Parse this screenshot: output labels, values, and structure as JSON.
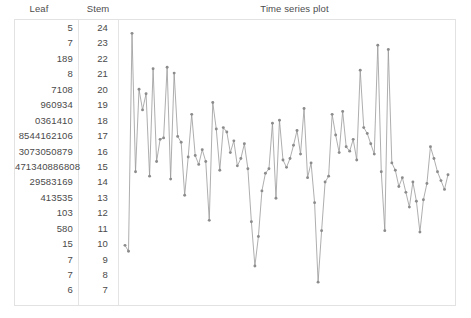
{
  "header": {
    "leaf_label": "Leaf",
    "stem_label": "Stem",
    "plot_title": "Time series plot"
  },
  "colors": {
    "text": "#4a4a4a",
    "border": "#e2e2e2",
    "series_line": "#999999",
    "series_marker": "#8c8c8c",
    "background": "#ffffff"
  },
  "stem_leaf": {
    "rows": [
      {
        "leaf": "5",
        "stem": "24"
      },
      {
        "leaf": "7",
        "stem": "23"
      },
      {
        "leaf": "189",
        "stem": "22"
      },
      {
        "leaf": "8",
        "stem": "21"
      },
      {
        "leaf": "7108",
        "stem": "20"
      },
      {
        "leaf": "960934",
        "stem": "19"
      },
      {
        "leaf": "0361410",
        "stem": "18"
      },
      {
        "leaf": "8544162106",
        "stem": "17"
      },
      {
        "leaf": "3073050879",
        "stem": "16"
      },
      {
        "leaf": "471340886808",
        "stem": "15"
      },
      {
        "leaf": "29583169",
        "stem": "14"
      },
      {
        "leaf": "413535",
        "stem": "13"
      },
      {
        "leaf": "103",
        "stem": "12"
      },
      {
        "leaf": "580",
        "stem": "11"
      },
      {
        "leaf": "15",
        "stem": "10"
      },
      {
        "leaf": "7",
        "stem": "9"
      },
      {
        "leaf": "7",
        "stem": "8"
      },
      {
        "leaf": "6",
        "stem": "7"
      }
    ]
  },
  "chart_data": {
    "type": "line",
    "title": "Time series plot",
    "xlabel": "",
    "ylabel": "",
    "grid": false,
    "legend": "none",
    "markers": true,
    "ylim": [
      70,
      250
    ],
    "xlim": [
      1,
      93
    ],
    "x": [
      1,
      2,
      3,
      4,
      5,
      6,
      7,
      8,
      9,
      10,
      11,
      12,
      13,
      14,
      15,
      16,
      17,
      18,
      19,
      20,
      21,
      22,
      23,
      24,
      25,
      26,
      27,
      28,
      29,
      30,
      31,
      32,
      33,
      34,
      35,
      36,
      37,
      38,
      39,
      40,
      41,
      42,
      43,
      44,
      45,
      46,
      47,
      48,
      49,
      50,
      51,
      52,
      53,
      54,
      55,
      56,
      57,
      58,
      59,
      60,
      61,
      62,
      63,
      64,
      65,
      66,
      67,
      68,
      69,
      70,
      71,
      72,
      73,
      74,
      75,
      76,
      77,
      78,
      79,
      80,
      81,
      82,
      83,
      84,
      85,
      86,
      87,
      88,
      89,
      90,
      91,
      92,
      93
    ],
    "values": [
      101,
      97,
      245,
      151,
      207,
      193,
      204,
      148,
      221,
      158,
      173,
      174,
      222,
      146,
      218,
      175,
      171,
      135,
      161,
      190,
      162,
      156,
      166,
      158,
      118,
      198,
      180,
      152,
      181,
      178,
      164,
      172,
      155,
      160,
      170,
      153,
      117,
      87,
      107,
      138,
      150,
      153,
      184,
      133,
      186,
      159,
      154,
      160,
      169,
      179,
      163,
      194,
      147,
      157,
      130,
      76,
      111,
      144,
      148,
      190,
      176,
      164,
      192,
      168,
      165,
      173,
      159,
      220,
      181,
      177,
      170,
      163,
      237,
      151,
      111,
      234,
      157,
      152,
      141,
      147,
      137,
      127,
      144,
      131,
      110,
      132,
      143,
      168,
      160,
      151,
      145,
      139,
      149
    ]
  }
}
